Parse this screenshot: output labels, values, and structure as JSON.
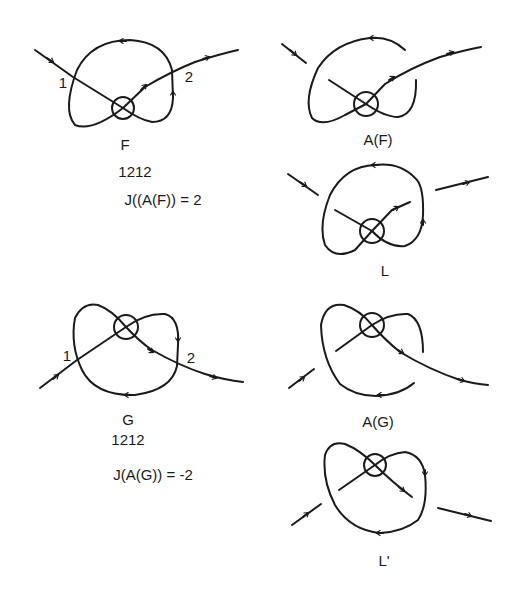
{
  "figure": {
    "stroke_color": "#1a1a1a",
    "background": "#ffffff"
  },
  "panels": {
    "F": {
      "name": "F",
      "word": "1212",
      "formula": "J((A(F)) = 2",
      "crossing_labels": [
        "1",
        "2"
      ]
    },
    "AF": {
      "name": "A(F)"
    },
    "L": {
      "name": "L"
    },
    "G": {
      "name": "G",
      "word": "1212",
      "formula": "J(A(G)) = -2",
      "crossing_labels": [
        "1",
        "2"
      ]
    },
    "AG": {
      "name": "A(G)"
    },
    "Lprime": {
      "name": "L'"
    }
  }
}
